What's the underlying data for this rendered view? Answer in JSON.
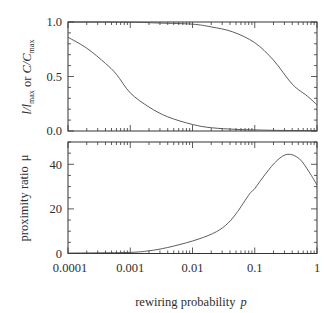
{
  "figure": {
    "xlabel": {
      "text": "rewiring probability",
      "var": "p"
    },
    "xticks": [
      "0.0001",
      "0.001",
      "0.01",
      "0.1",
      "1"
    ],
    "top_panel": {
      "ylabel_parts": [
        "l/l",
        "max",
        " or ",
        "C/C",
        "max"
      ],
      "yticks": [
        "0.0",
        "0.5",
        "1.0"
      ]
    },
    "bottom_panel": {
      "ylabel": "proximity ratio",
      "ylabel_var": "μ",
      "yticks": [
        "0",
        "20",
        "40"
      ]
    },
    "colors": {
      "axis": "#333333",
      "line": "#4a4a4a",
      "text": "#2e2e2e"
    }
  },
  "chart_data": [
    {
      "type": "line",
      "title": "",
      "xlabel": "rewiring probability p",
      "ylabel": "l/l_max or C/C_max",
      "xscale": "log",
      "xlim": [
        0.0001,
        1
      ],
      "ylim": [
        0,
        1
      ],
      "xticks": [
        0.0001,
        0.001,
        0.01,
        0.1,
        1
      ],
      "yticks": [
        0,
        0.5,
        1.0
      ],
      "yminor_step": 0.1,
      "grid": false,
      "legend": null,
      "series": [
        {
          "name": "C/C_max",
          "x": [
            0.0001,
            0.001,
            0.003,
            0.01,
            0.02,
            0.044,
            0.1,
            0.2,
            0.4,
            0.7,
            1
          ],
          "y": [
            1.0,
            0.998,
            0.99,
            0.98,
            0.955,
            0.91,
            0.81,
            0.65,
            0.43,
            0.32,
            0.24
          ]
        },
        {
          "name": "l/l_max",
          "x": [
            0.0001,
            0.0002,
            0.0004,
            0.0006,
            0.001,
            0.002,
            0.004,
            0.01,
            0.02,
            0.05,
            0.1,
            0.3,
            1
          ],
          "y": [
            0.86,
            0.76,
            0.62,
            0.52,
            0.35,
            0.22,
            0.13,
            0.06,
            0.03,
            0.015,
            0.01,
            0.005,
            0.003
          ]
        }
      ]
    },
    {
      "type": "line",
      "title": "",
      "xlabel": "rewiring probability p",
      "ylabel": "proximity ratio μ",
      "xscale": "log",
      "xlim": [
        0.0001,
        1
      ],
      "ylim": [
        0,
        50
      ],
      "xticks": [
        0.0001,
        0.001,
        0.01,
        0.1,
        1
      ],
      "yticks": [
        0,
        20,
        40
      ],
      "yminor_step": 5,
      "grid": false,
      "legend": null,
      "series": [
        {
          "name": "proximity ratio μ",
          "x": [
            0.0001,
            0.0003,
            0.001,
            0.002,
            0.004,
            0.01,
            0.021,
            0.034,
            0.05,
            0.083,
            0.1,
            0.15,
            0.23,
            0.34,
            0.52,
            0.75,
            1
          ],
          "y": [
            0.2,
            0.3,
            0.5,
            1.2,
            2.7,
            5.6,
            8.9,
            12.6,
            17.8,
            26.8,
            29.1,
            35.8,
            41.8,
            44.5,
            42.5,
            36.5,
            30.7
          ]
        }
      ]
    }
  ]
}
